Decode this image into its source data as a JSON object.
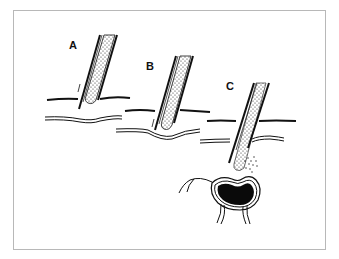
{
  "figure": {
    "panels": [
      {
        "id": "A",
        "label": "A",
        "description": "catheter tip approaching surface, tube tip at upper membrane line"
      },
      {
        "id": "B",
        "label": "B",
        "description": "catheter tip pressing and deforming lower double membrane"
      },
      {
        "id": "C",
        "label": "C",
        "description": "catheter penetrated both layers, particles released near dark lobed structure"
      }
    ],
    "colors": {
      "ink": "#111111",
      "frame": "#b8b8b8",
      "background": "#ffffff"
    }
  }
}
